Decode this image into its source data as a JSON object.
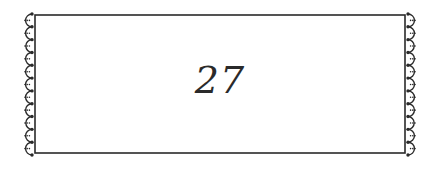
{
  "label": {
    "number": "27"
  },
  "frame": {
    "stroke_color": "#2a2a2a",
    "background": "#ffffff",
    "scallops_per_side": 11
  }
}
